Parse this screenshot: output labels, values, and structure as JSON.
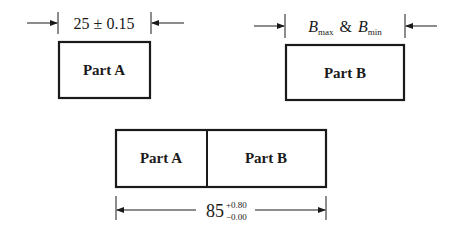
{
  "part_a": {
    "label": "Part A",
    "dimension": "25 ± 0.15"
  },
  "part_b": {
    "label": "Part B",
    "dimension_symbol": "B",
    "dimension_sub_max": "max",
    "dimension_and": "&",
    "dimension_sub_min": "min"
  },
  "assembly": {
    "left_label": "Part A",
    "right_label": "Part B",
    "dimension_nominal": "85",
    "tolerance_upper": "+0.80",
    "tolerance_lower": "−0.00"
  }
}
